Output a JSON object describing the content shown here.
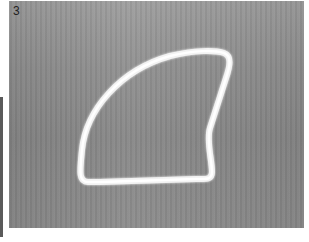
{
  "figure": {
    "label": "3"
  },
  "colors": {
    "background": "#8e8e8e",
    "outline": "#f4f4f4",
    "label": "#222222",
    "left_bar": "#5a5a5a"
  }
}
